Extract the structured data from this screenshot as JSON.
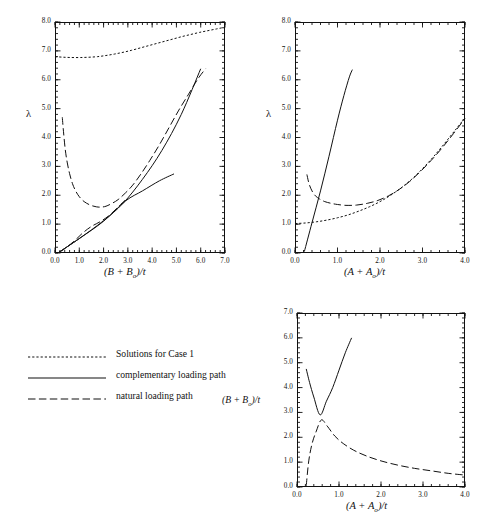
{
  "figure": {
    "background": "#ffffff",
    "ink": "#111111"
  },
  "legend": {
    "entries": [
      {
        "label": "Solutions for Case 1",
        "style": "dotted",
        "name": "legend-solutions-case-1"
      },
      {
        "label": "complementary loading path",
        "style": "solid",
        "name": "legend-complementary-loading-path"
      },
      {
        "label": "natural loading path",
        "style": "dashed",
        "name": "legend-natural-loading-path"
      }
    ]
  },
  "chart_data": [
    {
      "id": "panel-top-left",
      "type": "line",
      "title": "",
      "xlabel": "(B + Bₒ)/t",
      "ylabel": "λ",
      "xlim": [
        0.0,
        7.0
      ],
      "ylim": [
        0.0,
        8.0
      ],
      "xticks": [
        "0.0",
        "1.0",
        "2.0",
        "3.0",
        "4.0",
        "5.0",
        "6.0",
        "7.0"
      ],
      "yticks": [
        "0.0",
        "1.0",
        "2.0",
        "3.0",
        "4.0",
        "5.0",
        "6.0",
        "7.0",
        "8.0"
      ],
      "grid": false,
      "legend_position": "external-lower-left",
      "series": [
        {
          "name": "Solutions for Case 1",
          "style": "dotted",
          "x": [
            0.0,
            0.35,
            0.7,
            1.05,
            1.4,
            1.75,
            2.1,
            2.45,
            2.8,
            3.15,
            3.5,
            3.85,
            4.2,
            4.55,
            4.9,
            5.25,
            5.6,
            5.95,
            6.3,
            6.65,
            7.0
          ],
          "y": [
            6.8,
            6.78,
            6.77,
            6.77,
            6.78,
            6.8,
            6.84,
            6.89,
            6.95,
            7.02,
            7.1,
            7.18,
            7.26,
            7.34,
            7.42,
            7.5,
            7.57,
            7.64,
            7.7,
            7.76,
            7.82
          ]
        },
        {
          "name": "natural loading path",
          "style": "dashed",
          "x": [
            0.3,
            0.35,
            0.42,
            0.5,
            0.6,
            0.72,
            0.85,
            1.0,
            1.2,
            1.45,
            1.7,
            1.9,
            2.1,
            2.35,
            2.6,
            2.9,
            3.2,
            3.55,
            3.9,
            4.3,
            4.7,
            5.1,
            5.5,
            5.9,
            6.2
          ],
          "y": [
            4.7,
            4.2,
            3.6,
            3.15,
            2.75,
            2.4,
            2.15,
            1.95,
            1.78,
            1.66,
            1.6,
            1.59,
            1.62,
            1.72,
            1.85,
            2.08,
            2.35,
            2.75,
            3.2,
            3.75,
            4.35,
            4.95,
            5.5,
            6.05,
            6.38
          ]
        },
        {
          "name": "complementary loading path (steep)",
          "style": "solid",
          "x": [
            0.15,
            1.0,
            2.0,
            2.8,
            3.6,
            4.4,
            5.2,
            6.0
          ],
          "y": [
            0.02,
            0.5,
            1.12,
            1.72,
            2.55,
            3.55,
            4.8,
            6.38
          ]
        },
        {
          "name": "complementary loading path (shallow)",
          "style": "solid",
          "x": [
            0.15,
            1.0,
            2.0,
            2.9,
            3.6,
            4.3,
            4.9
          ],
          "y": [
            0.02,
            0.5,
            1.1,
            1.8,
            2.15,
            2.5,
            2.74
          ]
        },
        {
          "name": "natural loading path (lower branch)",
          "style": "dashed",
          "x": [
            0.18,
            0.45,
            0.8,
            1.15,
            1.5,
            1.85,
            2.2,
            2.55,
            2.9
          ],
          "y": [
            0.02,
            0.18,
            0.42,
            0.7,
            0.92,
            1.08,
            1.28,
            1.55,
            1.85
          ]
        }
      ]
    },
    {
      "id": "panel-top-right",
      "type": "line",
      "title": "",
      "xlabel": "(A + Aₒ)/t",
      "ylabel": "λ",
      "xlim": [
        0.0,
        4.0
      ],
      "ylim": [
        0.0,
        8.0
      ],
      "xticks": [
        "0.0",
        "1.0",
        "2.0",
        "3.0",
        "4.0"
      ],
      "yticks": [
        "0.0",
        "1.0",
        "2.0",
        "3.0",
        "4.0",
        "5.0",
        "6.0",
        "7.0",
        "8.0"
      ],
      "grid": false,
      "legend_position": "external-lower-left",
      "series": [
        {
          "name": "Solutions for Case 1",
          "style": "dotted",
          "x": [
            0.0,
            0.25,
            0.5,
            0.75,
            1.0,
            1.25,
            1.5,
            1.75,
            2.0,
            2.25,
            2.5,
            2.75,
            3.0,
            3.25,
            3.5,
            3.75,
            4.0
          ],
          "y": [
            1.02,
            1.04,
            1.08,
            1.14,
            1.22,
            1.32,
            1.45,
            1.6,
            1.78,
            2.0,
            2.26,
            2.56,
            2.92,
            3.32,
            3.76,
            4.22,
            4.68
          ]
        },
        {
          "name": "natural loading path",
          "style": "dashed",
          "x": [
            0.28,
            0.33,
            0.4,
            0.48,
            0.58,
            0.7,
            0.85,
            1.0,
            1.2,
            1.45,
            1.7,
            1.95,
            2.2,
            2.45,
            2.7,
            2.95,
            3.2,
            3.45,
            3.7,
            4.0
          ],
          "y": [
            2.72,
            2.4,
            2.15,
            1.98,
            1.87,
            1.78,
            1.72,
            1.68,
            1.65,
            1.66,
            1.72,
            1.82,
            1.98,
            2.2,
            2.48,
            2.82,
            3.2,
            3.62,
            4.08,
            4.66
          ]
        },
        {
          "name": "complementary loading path",
          "style": "solid",
          "x": [
            0.22,
            0.4,
            0.6,
            0.8,
            1.0,
            1.15,
            1.28,
            1.35
          ],
          "y": [
            0.05,
            1.05,
            2.15,
            3.35,
            4.6,
            5.45,
            6.1,
            6.35
          ]
        }
      ]
    },
    {
      "id": "panel-bottom-right",
      "type": "line",
      "title": "",
      "xlabel": "(A + Aₒ)/t",
      "ylabel": "(B + Bₒ)/t",
      "xlim": [
        0.0,
        4.0
      ],
      "ylim": [
        0.0,
        7.0
      ],
      "xticks": [
        "0.0",
        "1.0",
        "2.0",
        "3.0",
        "4.0"
      ],
      "yticks": [
        "0.0",
        "1.0",
        "2.0",
        "3.0",
        "4.0",
        "5.0",
        "6.0",
        "7.0"
      ],
      "grid": false,
      "legend_position": "external-lower-left",
      "series": [
        {
          "name": "complementary loading path",
          "style": "solid",
          "x": [
            0.22,
            0.3,
            0.4,
            0.55,
            0.7,
            0.85,
            1.0,
            1.15,
            1.3
          ],
          "y": [
            4.75,
            4.2,
            3.62,
            2.9,
            3.45,
            4.0,
            4.7,
            5.4,
            6.0
          ]
        },
        {
          "name": "natural loading path",
          "style": "dashed",
          "x": [
            0.22,
            0.28,
            0.36,
            0.46,
            0.58,
            0.72,
            0.9,
            1.1,
            1.35,
            1.65,
            2.0,
            2.4,
            2.8,
            3.2,
            3.6,
            4.0
          ],
          "y": [
            0.05,
            1.05,
            1.75,
            2.25,
            2.7,
            2.45,
            2.05,
            1.75,
            1.48,
            1.25,
            1.05,
            0.88,
            0.75,
            0.65,
            0.55,
            0.48
          ]
        }
      ]
    }
  ]
}
